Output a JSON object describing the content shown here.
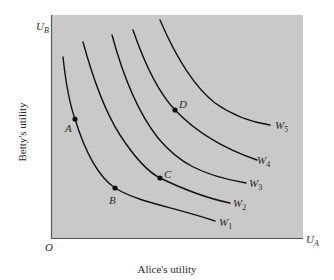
{
  "diagram": {
    "type": "welfare-isoquant / social indifference curves",
    "background_panel_color": "#c8c8c8",
    "curve_color": "#111111",
    "axes": {
      "origin_label": "O",
      "x_axis_symbol": "U",
      "x_axis_subscript": "A",
      "y_axis_symbol": "U",
      "y_axis_subscript": "B",
      "x_axis_title": "Alice's utility",
      "y_axis_title": "Betty's utility"
    },
    "curves": [
      {
        "name": "W",
        "sub": "1"
      },
      {
        "name": "W",
        "sub": "2"
      },
      {
        "name": "W",
        "sub": "3"
      },
      {
        "name": "W",
        "sub": "4"
      },
      {
        "name": "W",
        "sub": "5"
      }
    ],
    "points": [
      {
        "label": "A",
        "on_curve": "W1"
      },
      {
        "label": "B",
        "on_curve": "W1"
      },
      {
        "label": "C",
        "on_curve": "W2"
      },
      {
        "label": "D",
        "on_curve": "W4"
      }
    ]
  }
}
